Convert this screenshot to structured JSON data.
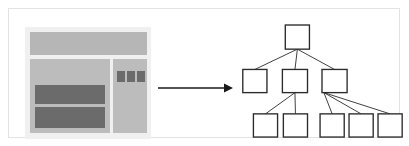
{
  "figure": {
    "frame": {
      "border_color": "#e3e3e3",
      "background": "#ffffff"
    }
  },
  "wireframe": {
    "label": "webpage-wireframe",
    "panel_background": "#f0f0f0",
    "region_color": "#bcbcbc",
    "header_color": "#b6b6b6",
    "block_color": "#6b6b6b",
    "regions": [
      {
        "name": "header-bar",
        "label": "Header"
      },
      {
        "name": "main-content",
        "label": "Main content"
      },
      {
        "name": "sidebar-panel",
        "label": "Sidebar"
      }
    ],
    "content_blocks": [
      {
        "name": "content-block-1",
        "label": "Article block 1"
      },
      {
        "name": "content-block-2",
        "label": "Article block 2"
      }
    ],
    "sidebar_chips": [
      {
        "name": "sidebar-chip-1",
        "label": "Widget 1"
      },
      {
        "name": "sidebar-chip-2",
        "label": "Widget 2"
      },
      {
        "name": "sidebar-chip-3",
        "label": "Widget 3"
      }
    ]
  },
  "arrow": {
    "label": "maps-to-arrow",
    "direction": "right",
    "color": "#1a1a1a"
  },
  "chart_data": {
    "type": "diagram",
    "diagram_type": "tree",
    "node_fill": "#ffffff",
    "node_stroke": "#2b2b2b",
    "edge_color": "#3a3a3a",
    "nodes": [
      {
        "id": "n0",
        "label": "",
        "level": 0,
        "x": 50,
        "y": 4,
        "w": 25,
        "h": 25
      },
      {
        "id": "n1",
        "label": "",
        "level": 1,
        "x": 6,
        "y": 50,
        "w": 25,
        "h": 24
      },
      {
        "id": "n2",
        "label": "",
        "level": 1,
        "x": 47,
        "y": 50,
        "w": 26,
        "h": 24
      },
      {
        "id": "n3",
        "label": "",
        "level": 1,
        "x": 88,
        "y": 50,
        "w": 26,
        "h": 24
      },
      {
        "id": "n4",
        "label": "",
        "level": 2,
        "x": 17,
        "y": 96,
        "w": 25,
        "h": 24
      },
      {
        "id": "n5",
        "label": "",
        "level": 2,
        "x": 48,
        "y": 96,
        "w": 25,
        "h": 24
      },
      {
        "id": "n6",
        "label": "",
        "level": 2,
        "x": 86,
        "y": 96,
        "w": 25,
        "h": 24
      },
      {
        "id": "n7",
        "label": "",
        "level": 2,
        "x": 116,
        "y": 96,
        "w": 25,
        "h": 24
      },
      {
        "id": "n8",
        "label": "",
        "level": 2,
        "x": 146,
        "y": 96,
        "w": 25,
        "h": 24
      }
    ],
    "edges": [
      {
        "from": "n0",
        "to": "n1"
      },
      {
        "from": "n0",
        "to": "n2"
      },
      {
        "from": "n0",
        "to": "n3"
      },
      {
        "from": "n2",
        "to": "n4"
      },
      {
        "from": "n2",
        "to": "n5"
      },
      {
        "from": "n3",
        "to": "n6"
      },
      {
        "from": "n3",
        "to": "n7"
      },
      {
        "from": "n3",
        "to": "n8"
      }
    ],
    "counts": {
      "levels": 3,
      "total_nodes": 9,
      "root": 1,
      "level_1": 3,
      "level_2": 5
    }
  }
}
